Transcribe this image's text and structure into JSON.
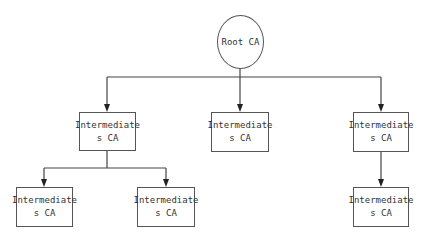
{
  "diagram": {
    "root": {
      "label": "Root CA"
    },
    "nodes": [
      {
        "line1": "Intermediate",
        "line2": "s CA"
      },
      {
        "line1": "Intermediate",
        "line2": "s CA"
      },
      {
        "line1": "Intermediate",
        "line2": "s CA"
      },
      {
        "line1": "Intermediate",
        "line2": "s CA"
      },
      {
        "line1": "Intermediate",
        "line2": "s CA"
      },
      {
        "line1": "Intermediate",
        "line2": "s CA"
      }
    ],
    "edges": [
      [
        "Root CA",
        "Intermediate s CA (left)"
      ],
      [
        "Root CA",
        "Intermediate s CA (middle)"
      ],
      [
        "Root CA",
        "Intermediate s CA (right)"
      ],
      [
        "Intermediate s CA (left)",
        "Intermediate s CA (bottom-left)"
      ],
      [
        "Intermediate s CA (left)",
        "Intermediate s CA (bottom-middle)"
      ],
      [
        "Intermediate s CA (right)",
        "Intermediate s CA (bottom-right)"
      ]
    ],
    "colors": {
      "line": "#444444",
      "border": "#555555",
      "text": "#333333"
    }
  }
}
